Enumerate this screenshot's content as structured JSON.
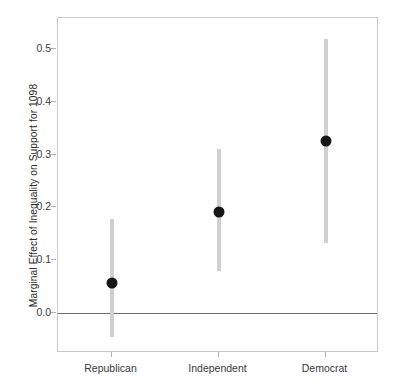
{
  "chart_data": {
    "type": "scatter",
    "title": "",
    "xlabel": "",
    "ylabel": "Marginal Effect of Inequality on Support for 1098",
    "categories": [
      "Republican",
      "Independent",
      "Democrat"
    ],
    "values": [
      0.057,
      0.192,
      0.326
    ],
    "error_low": [
      -0.045,
      0.08,
      0.133
    ],
    "error_high": [
      0.179,
      0.31,
      0.518
    ],
    "ylim": [
      -0.075,
      0.558
    ],
    "yticks": [
      0.0,
      0.1,
      0.2,
      0.3,
      0.4,
      0.5
    ],
    "ytick_labels": [
      "0.0",
      "0.1",
      "0.2",
      "0.3",
      "0.4",
      "0.5"
    ],
    "grid": false,
    "legend": "none",
    "reference_line": 0.0,
    "series": [
      {
        "name": "Marginal Effect",
        "points": [
          {
            "category": "Republican",
            "estimate": 0.057,
            "ci_low": -0.045,
            "ci_high": 0.179
          },
          {
            "category": "Independent",
            "estimate": 0.192,
            "ci_low": 0.08,
            "ci_high": 0.31
          },
          {
            "category": "Democrat",
            "estimate": 0.326,
            "ci_low": 0.133,
            "ci_high": 0.518
          }
        ]
      }
    ],
    "colors": {
      "point": "#161616",
      "errorbar": "#d0d0d0",
      "zero_line": "#6e6e6e",
      "frame": "#c9c9c9",
      "tick_label": "#3a3a3a",
      "axis_title": "#2b2b2b",
      "background": "#ffffff"
    }
  }
}
